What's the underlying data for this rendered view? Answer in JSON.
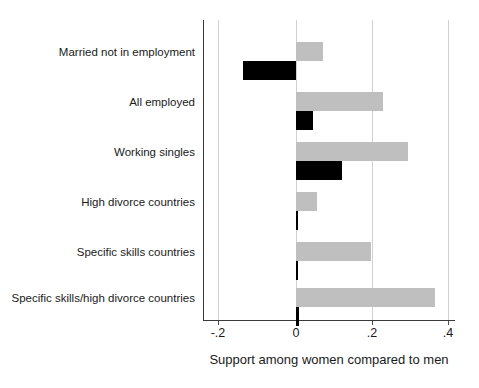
{
  "chart_data": {
    "type": "bar",
    "orientation": "horizontal",
    "title": "",
    "subtitle": "",
    "xlabel": "Support among women compared to men",
    "ylabel": "",
    "xlim": [
      -0.25,
      0.42
    ],
    "xticks": [
      -0.2,
      0,
      0.2,
      0.4
    ],
    "xticklabels": [
      "-.2",
      "0",
      ".2",
      ".4"
    ],
    "grid": "vertical",
    "legend": "none",
    "categories": [
      "Married not in employment",
      "All employed",
      "Working singles",
      "High divorce countries",
      "Specific skills countries",
      "Specific skills/high divorce countries"
    ],
    "series": [
      {
        "name": "gray-series",
        "color": "#bfbfbf",
        "values": [
          0.071,
          0.229,
          0.295,
          0.055,
          0.197,
          0.366
        ]
      },
      {
        "name": "black-series",
        "color": "#000000",
        "values": [
          -0.139,
          0.045,
          0.121,
          0.003,
          0.003,
          0.008
        ]
      }
    ]
  },
  "axis": {
    "x_title": "Support among women compared to men",
    "tick_labels": [
      "-.2",
      "0",
      ".2",
      ".4"
    ]
  },
  "categories": [
    "Married not in employment",
    "All employed",
    "Working singles",
    "High divorce countries",
    "Specific skills countries",
    "Specific skills/high divorce countries"
  ],
  "colors": {
    "gray_bar": "#bfbfbf",
    "black_bar": "#000000",
    "gridline": "#d2d2d2",
    "axis": "#3a3a3a",
    "background": "#ffffff",
    "text": "#1a1a1a"
  }
}
